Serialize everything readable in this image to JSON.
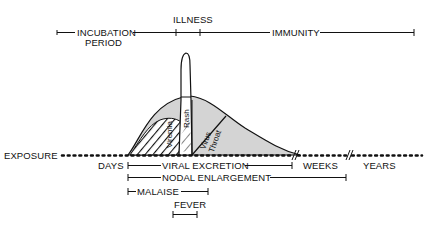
{
  "diagram": {
    "type": "timeline",
    "colors": {
      "ink": "#111111",
      "fill_gray": "#d4d4d4",
      "background": "#ffffff"
    },
    "top_phases": [
      {
        "label": "INCUBATION",
        "sublabel": "PERIOD"
      },
      {
        "label": "ILLNESS"
      },
      {
        "label": "IMMUNITY"
      }
    ],
    "curve_regions": [
      {
        "label": "Viremia",
        "pattern": "hatched"
      },
      {
        "label": "Rash",
        "pattern": "tall-peak"
      },
      {
        "label": "Virus Throat",
        "pattern": "gray"
      }
    ],
    "baseline": {
      "start_label": "EXPOSURE",
      "scale_labels": [
        "DAYS",
        "WEEKS",
        "YEARS"
      ]
    },
    "bottom_bars": [
      {
        "label": "VIRAL EXCRETION"
      },
      {
        "label": "NODAL ENLARGEMENT"
      },
      {
        "label": "MALAISE"
      },
      {
        "label": "FEVER"
      }
    ]
  }
}
